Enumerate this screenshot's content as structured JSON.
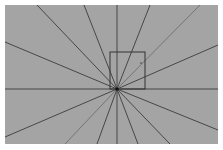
{
  "diagram": {
    "background": "#ffffff",
    "panel": {
      "x": 5,
      "y": 5,
      "w": 213,
      "h": 139,
      "fill": "#a4a4a4"
    },
    "center": {
      "x": 117,
      "y": 89
    },
    "line_color": "#3c3c3c",
    "light_line_color": "#6e6e6e",
    "rays": [
      {
        "to": [
          37,
          5
        ]
      },
      {
        "to": [
          84,
          5
        ]
      },
      {
        "to": [
          117,
          5
        ]
      },
      {
        "to": [
          150,
          5
        ]
      },
      {
        "to": [
          200,
          5
        ],
        "light": true
      },
      {
        "to": [
          218,
          45
        ]
      },
      {
        "to": [
          218,
          89
        ]
      },
      {
        "to": [
          218,
          130
        ]
      },
      {
        "to": [
          170,
          144
        ]
      },
      {
        "to": [
          138,
          144
        ]
      },
      {
        "to": [
          117,
          144
        ]
      },
      {
        "to": [
          97,
          144
        ]
      },
      {
        "to": [
          65,
          144
        ],
        "light": true
      },
      {
        "to": [
          5,
          137
        ]
      },
      {
        "to": [
          5,
          89
        ]
      },
      {
        "to": [
          5,
          42
        ]
      }
    ],
    "box": {
      "x": 110,
      "y": 52,
      "w": 35,
      "h": 37,
      "stroke": "#333333"
    },
    "marker": {
      "x": 141,
      "y": 63
    }
  }
}
